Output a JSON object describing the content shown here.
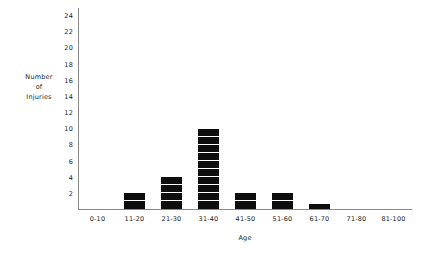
{
  "chart_data": {
    "type": "bar",
    "title": "",
    "subtitle": "",
    "xlabel": "Age",
    "ylabel": "Number of Injuries",
    "ylabel_lines": [
      "Number",
      "of",
      "Injuries"
    ],
    "categories": [
      "0-10",
      "11-20",
      "21-30",
      "31-40",
      "41-50",
      "51-60",
      "61-70",
      "71-80",
      "81-100"
    ],
    "values": [
      0,
      2,
      4,
      10,
      2,
      2,
      1,
      0,
      0
    ],
    "ylim": [
      0,
      25
    ],
    "ytick_labels": [
      "2",
      "4",
      "6",
      "8",
      "10",
      "12",
      "14",
      "16",
      "18",
      "20",
      "22",
      "24"
    ],
    "ytick_values": [
      2,
      4,
      6,
      8,
      10,
      12,
      14,
      16,
      18,
      20,
      22,
      24
    ],
    "grid": false,
    "legend": null,
    "bar_style": "stacked-unit-blocks",
    "bar_color": "#0d0d0d",
    "axis_color": "#8a8a8a",
    "background_color": "#ffffff",
    "text_color": "#1a1a1a"
  }
}
